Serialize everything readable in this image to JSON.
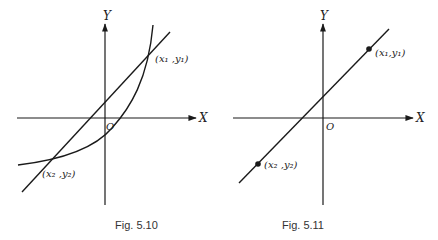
{
  "figures": [
    {
      "caption": "Fig. 5.10",
      "x_axis_label": "X",
      "y_axis_label": "Y",
      "origin_label": "O",
      "point1_label": "(x₁ ,y₁)",
      "point2_label": "(x₂ ,y₂)",
      "description": "A straight line intersecting a curve at two points"
    },
    {
      "caption": "Fig. 5.11",
      "x_axis_label": "X",
      "y_axis_label": "Y",
      "origin_label": "O",
      "point1_label": "(x₁,y₁)",
      "point2_label": "(x₂ ,y₂)",
      "description": "A straight line through two marked points"
    }
  ],
  "colors": {
    "stroke": "#1a1a1a",
    "background": "#ffffff"
  }
}
